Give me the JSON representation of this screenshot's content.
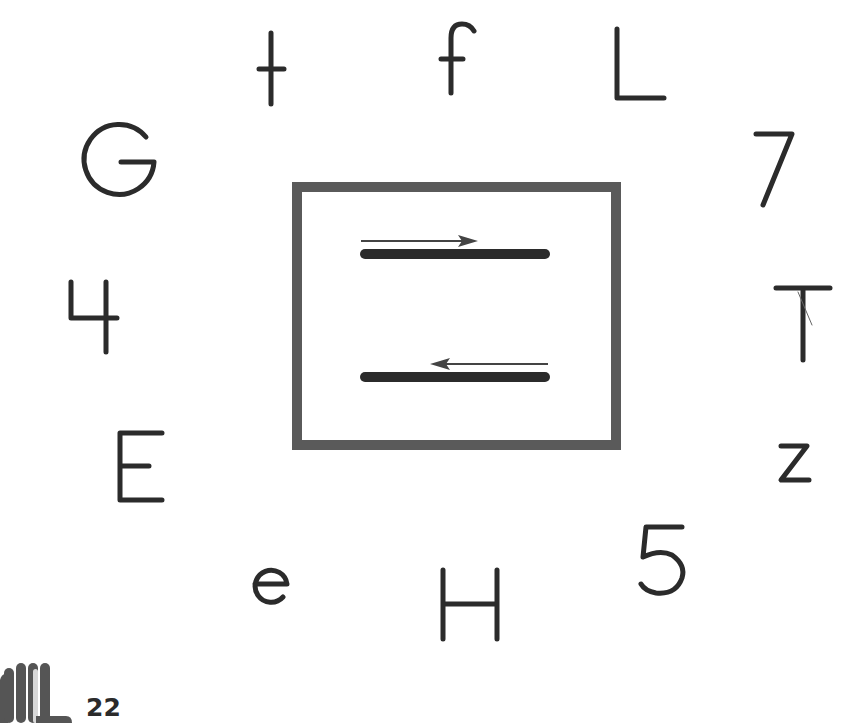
{
  "page": {
    "page_number": "22"
  },
  "center_box": {
    "lines": [
      {
        "id": "top-line",
        "arrow_direction": "right"
      },
      {
        "id": "bottom-line",
        "arrow_direction": "left"
      }
    ],
    "frame_color": "#5a5a5a",
    "line_color": "#2b2b2b"
  },
  "characters": [
    {
      "char": "t",
      "position": "top-left"
    },
    {
      "char": "f",
      "position": "top-center"
    },
    {
      "char": "L",
      "position": "top-right"
    },
    {
      "char": "G",
      "position": "left-upper"
    },
    {
      "char": "7",
      "position": "right-upper"
    },
    {
      "char": "4",
      "position": "left-middle"
    },
    {
      "char": "T",
      "position": "right-middle"
    },
    {
      "char": "E",
      "position": "left-lower"
    },
    {
      "char": "z",
      "position": "right-lower"
    },
    {
      "char": "5",
      "position": "bottom-right"
    },
    {
      "char": "H",
      "position": "bottom-center"
    },
    {
      "char": "e",
      "position": "bottom-left"
    }
  ],
  "icons": {
    "hand": "hand-icon"
  },
  "colors": {
    "ink": "#2b2b2b",
    "frame": "#5a5a5a",
    "hand": "#555555",
    "hand_finger_highlight": "#d8d8d8"
  }
}
